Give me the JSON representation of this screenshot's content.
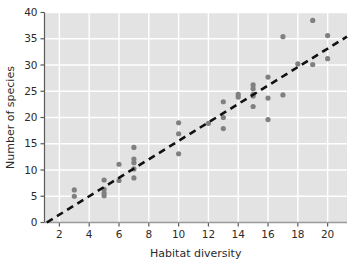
{
  "chart_data": {
    "type": "scatter",
    "title": "",
    "xlabel": "Habitat diversity",
    "ylabel": "Number of species",
    "xlim": [
      1,
      21.3
    ],
    "ylim": [
      0,
      40
    ],
    "xticks": [
      2,
      4,
      6,
      8,
      10,
      12,
      14,
      16,
      18,
      20
    ],
    "yticks": [
      0,
      5,
      10,
      15,
      20,
      25,
      30,
      35,
      40
    ],
    "xtick_labels": [
      "2",
      "4",
      "6",
      "8",
      "10",
      "12",
      "14",
      "16",
      "18",
      "20"
    ],
    "ytick_labels": [
      "0",
      "5",
      "10",
      "15",
      "20",
      "25",
      "30",
      "35",
      "40"
    ],
    "grid": true,
    "grid_color": "#ffffff",
    "plot_background": "#e3e3e3",
    "point_color": "#808080",
    "point_radius": 2.6,
    "legend": null,
    "points": [
      {
        "x": 3,
        "y": 6.2
      },
      {
        "x": 3,
        "y": 5.0
      },
      {
        "x": 5,
        "y": 8.1
      },
      {
        "x": 5,
        "y": 6.3
      },
      {
        "x": 5,
        "y": 5.6
      },
      {
        "x": 5,
        "y": 5.1
      },
      {
        "x": 6,
        "y": 11.1
      },
      {
        "x": 6,
        "y": 8.0
      },
      {
        "x": 7,
        "y": 14.3
      },
      {
        "x": 7,
        "y": 12.1
      },
      {
        "x": 7,
        "y": 11.4
      },
      {
        "x": 7,
        "y": 10.2
      },
      {
        "x": 7,
        "y": 8.5
      },
      {
        "x": 10,
        "y": 19.0
      },
      {
        "x": 10,
        "y": 16.9
      },
      {
        "x": 10,
        "y": 13.1
      },
      {
        "x": 12,
        "y": 18.9
      },
      {
        "x": 13,
        "y": 23.0
      },
      {
        "x": 13,
        "y": 20.0
      },
      {
        "x": 13,
        "y": 17.9
      },
      {
        "x": 14,
        "y": 24.4
      },
      {
        "x": 14,
        "y": 23.9
      },
      {
        "x": 15,
        "y": 26.2
      },
      {
        "x": 15,
        "y": 25.5
      },
      {
        "x": 15,
        "y": 24.4
      },
      {
        "x": 15,
        "y": 24.1
      },
      {
        "x": 15,
        "y": 22.1
      },
      {
        "x": 16,
        "y": 27.7
      },
      {
        "x": 16,
        "y": 23.7
      },
      {
        "x": 16,
        "y": 19.6
      },
      {
        "x": 17,
        "y": 35.4
      },
      {
        "x": 17,
        "y": 24.3
      },
      {
        "x": 18,
        "y": 30.2
      },
      {
        "x": 19,
        "y": 38.5
      },
      {
        "x": 19,
        "y": 30.1
      },
      {
        "x": 20,
        "y": 35.6
      },
      {
        "x": 20,
        "y": 31.2
      }
    ],
    "trendline": {
      "style": "dashed",
      "color": "#111111",
      "x_start": 1.15,
      "y_start": 0.0,
      "x_end": 21.3,
      "y_end": 35.4
    }
  }
}
